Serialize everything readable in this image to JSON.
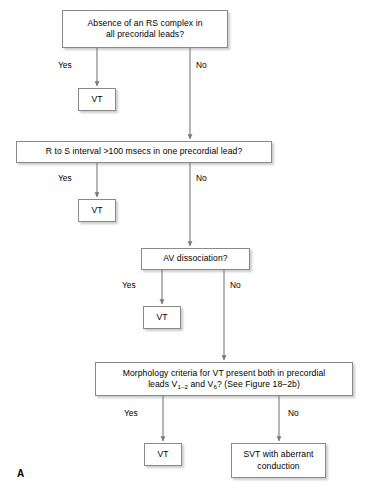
{
  "figure": {
    "panel_label": "A",
    "line_color": "#7a7a7a",
    "box_border_color": "#8a8a8a",
    "box_fill": "#ffffff",
    "text_color": "#000000"
  },
  "nodes": {
    "q1": {
      "id": "absence-of-rs-complex",
      "line1": "Absence of an RS complex in",
      "line2": "all precoridal leads?"
    },
    "vt1": {
      "id": "vt-outcome-1",
      "label": "VT"
    },
    "q2": {
      "id": "r-to-s-interval",
      "line1": "R to S interval >100 msecs in one precordial lead?"
    },
    "vt2": {
      "id": "vt-outcome-2",
      "label": "VT"
    },
    "q3": {
      "id": "av-dissociation",
      "line1": "AV dissociation?"
    },
    "vt3": {
      "id": "vt-outcome-3",
      "label": "VT"
    },
    "q4": {
      "id": "morphology-criteria",
      "line1": "Morphology criteria for VT present both in precordial",
      "line2_a": "leads V",
      "line2_sub1": "1–2",
      "line2_b": " and V",
      "line2_sub2": "6",
      "line2_c": "? (See Figure 18–2b)"
    },
    "vt4": {
      "id": "vt-outcome-4",
      "label": "VT"
    },
    "svt": {
      "id": "svt-aberrant-conduction",
      "line1": "SVT with aberrant",
      "line2": "conduction"
    }
  },
  "edge_labels": {
    "yes1": "Yes",
    "no1": "No",
    "yes2": "Yes",
    "no2": "No",
    "yes3": "Yes",
    "no3": "No",
    "yes4": "Yes",
    "no4": "No"
  }
}
